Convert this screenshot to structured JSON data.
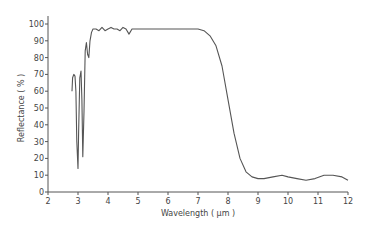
{
  "chart_data": {
    "type": "line",
    "title": "",
    "xlabel": "Wavelength ( µm )",
    "ylabel": "Reflectance ( % )",
    "xlim": [
      2,
      12
    ],
    "ylim": [
      0,
      100
    ],
    "xticks": [
      2,
      3,
      4,
      5,
      6,
      7,
      8,
      9,
      10,
      11,
      12
    ],
    "yticks": [
      0,
      10,
      20,
      30,
      40,
      50,
      60,
      70,
      80,
      90,
      100
    ],
    "grid": false,
    "legend": null,
    "series": [
      {
        "name": "Reflectance",
        "color": "#555555",
        "x": [
          2.8,
          2.82,
          2.86,
          2.9,
          2.93,
          2.96,
          3.0,
          3.02,
          3.06,
          3.1,
          3.13,
          3.16,
          3.2,
          3.24,
          3.28,
          3.32,
          3.36,
          3.4,
          3.45,
          3.5,
          3.6,
          3.7,
          3.8,
          3.9,
          4.0,
          4.1,
          4.2,
          4.3,
          4.4,
          4.5,
          4.6,
          4.7,
          4.8,
          5.0,
          5.5,
          6.0,
          6.5,
          7.0,
          7.2,
          7.4,
          7.6,
          7.8,
          8.0,
          8.2,
          8.4,
          8.6,
          8.8,
          9.0,
          9.2,
          9.5,
          9.8,
          10.0,
          10.3,
          10.6,
          10.9,
          11.2,
          11.5,
          11.8,
          12.0
        ],
        "y": [
          60,
          68,
          70,
          69,
          60,
          30,
          14,
          35,
          68,
          72,
          55,
          21,
          48,
          84,
          89,
          82,
          80,
          90,
          95,
          97,
          97,
          96,
          98,
          96,
          97,
          98,
          97,
          97,
          96,
          98,
          97,
          94,
          97,
          97,
          97,
          97,
          97,
          97,
          96,
          93,
          87,
          75,
          55,
          35,
          20,
          12,
          9,
          8,
          8,
          9,
          10,
          9,
          8,
          7,
          8,
          10,
          10,
          9,
          7
        ]
      }
    ]
  }
}
